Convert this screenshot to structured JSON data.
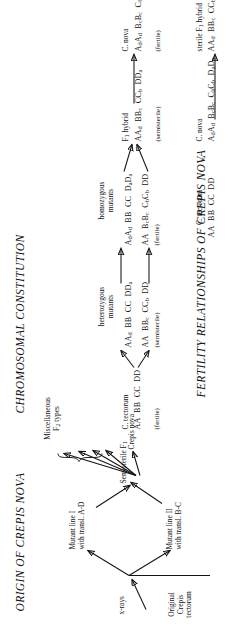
{
  "figure": {
    "panel1": {
      "title": "ORIGIN OF CREPIS NOVA",
      "origin_label_l1": "Original",
      "origin_label_l2": "Crepis",
      "origin_label_l3": "tectorum",
      "xrays_label": "x-rays",
      "mutant1_l1": "Mutant line I",
      "mutant1_l2": "with transl. A-D",
      "mutant2_l1": "Mutant line II",
      "mutant2_l2": "with transl. B-C",
      "semisterile_f1": "Semisterile F",
      "semisterile_f1_sub": "1",
      "misc_l1": "Miscellaneous",
      "misc_l2": "F",
      "misc_l2_sub": "2",
      "misc_l2_rest": " types",
      "crepis_nova": "Crepis nova"
    },
    "panel2": {
      "title": "CHROMOSOMAL CONSTITUTION",
      "col1_name": "C. tectorum",
      "col1_genotype": "AA  BB  CC  DD",
      "col1_note": "(fertile)",
      "col2_header_l1": "heterozygous",
      "col2_header_l2": "mutants",
      "col2_row1": "AA_d  BB  CC  DD_a",
      "col2_row2": "AA  BB_c  CC_b  DD",
      "col2_note": "(semisterile)",
      "col3_header_l1": "homozygous",
      "col3_header_l2": "mutants",
      "col3_row1": "A_dA_d  BB  CC  D_aD_a",
      "col3_row2": "AA  B_cB_c  C_bC_b  DD",
      "col3_note": "(fertile)",
      "col4_header": "F_1 hybrid",
      "col4_row": "AA_d  BB_c  CC_b  DD_a",
      "col4_note": "(semisterile)",
      "col5_header": "C. nova",
      "col5_row": "A_dA_d  B_cB_c  C_bC_b  D_aD_a",
      "col5_note": "(fertile)"
    },
    "panel3": {
      "title": "FERTILITY RELATIONSHIPS OF CREPIS NOVA",
      "parent1_name": "C. tectorum",
      "parent1_genotype": "AA  BB  CC  DD",
      "cross_symbol": "×",
      "parent2_name": "C. nova",
      "parent2_genotype": "A_dA_d  B_cB_c  C_bC_b  D_aD_a",
      "offspring_l1": "sterile F_1 hybrid",
      "offspring_l2": "AA_d  BB_c  CC_b  DD_a"
    }
  }
}
